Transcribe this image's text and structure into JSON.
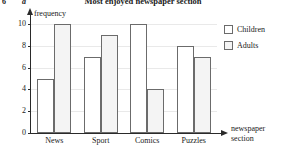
{
  "question": {
    "number": "6",
    "part": "a"
  },
  "axis": {
    "y_label": "frequency",
    "x_label_line1": "newspaper",
    "x_label_line2": "section",
    "y_ticks": [
      "0",
      "2",
      "4",
      "6",
      "8",
      "10"
    ]
  },
  "legend": {
    "position": "top-right",
    "items": [
      {
        "label": "Children",
        "color": "#ffffff"
      },
      {
        "label": "Adults",
        "color": "#f4f4f4"
      }
    ]
  },
  "chart_data": {
    "type": "bar",
    "title": "Most enjoyed newspaper section",
    "xlabel": "newspaper section",
    "ylabel": "frequency",
    "categories": [
      "News",
      "Sport",
      "Comics",
      "Puzzles"
    ],
    "series": [
      {
        "name": "Children",
        "values": [
          5,
          7,
          10,
          8
        ],
        "color": "#ffffff"
      },
      {
        "name": "Adults",
        "values": [
          10,
          9,
          4,
          7
        ],
        "color": "#f4f4f4"
      }
    ],
    "ylim": [
      0,
      10
    ],
    "ytick_step": 2,
    "grid": true,
    "grid_axis": "y",
    "legend_position": "top-right"
  }
}
